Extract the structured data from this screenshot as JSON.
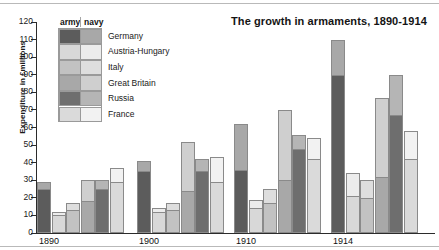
{
  "chart_data": {
    "type": "bar",
    "subtype": "grouped-stacked",
    "title": "The growth in armaments, 1890-1914",
    "xlabel": "",
    "ylabel": "Expenditure in £millions",
    "ylim": [
      0,
      120
    ],
    "ytick_step": 10,
    "yticks": [
      0,
      10,
      20,
      30,
      40,
      50,
      60,
      70,
      80,
      90,
      100,
      110,
      120
    ],
    "grid": false,
    "legend_position": "top-left",
    "legend_headers": [
      "army",
      "navy"
    ],
    "categories": [
      "1890",
      "1900",
      "1910",
      "1914"
    ],
    "series": [
      {
        "name": "Germany",
        "army_color": "#5c5c5c",
        "navy_color": "#a8a8a8",
        "army": [
          25,
          35,
          36,
          90
        ],
        "navy": [
          4,
          6,
          26,
          20
        ],
        "totals": [
          29,
          41,
          62,
          110
        ]
      },
      {
        "name": "Austria-Hungary",
        "army_color": "#d8d8d8",
        "navy_color": "#ececec",
        "army": [
          10,
          12,
          14,
          21
        ],
        "navy": [
          2,
          2,
          5,
          13
        ],
        "totals": [
          12,
          14,
          19,
          34
        ]
      },
      {
        "name": "Italy",
        "army_color": "#c2c2c2",
        "navy_color": "#dedede",
        "army": [
          13,
          13,
          17,
          20
        ],
        "navy": [
          4,
          4,
          8,
          10
        ],
        "totals": [
          17,
          17,
          25,
          30
        ]
      },
      {
        "name": "Great Britain",
        "army_color": "#a8a8a8",
        "navy_color": "#cfcfcf",
        "army": [
          18,
          24,
          30,
          32
        ],
        "navy": [
          12,
          28,
          40,
          45
        ],
        "totals": [
          30,
          52,
          70,
          77
        ]
      },
      {
        "name": "Russia",
        "army_color": "#6e6e6e",
        "navy_color": "#b5b5b5",
        "army": [
          25,
          35,
          48,
          67
        ],
        "navy": [
          5,
          7,
          8,
          23
        ],
        "totals": [
          30,
          42,
          56,
          90
        ]
      },
      {
        "name": "France",
        "army_color": "#dadada",
        "navy_color": "#f2f2f2",
        "army": [
          29,
          29,
          42,
          42
        ],
        "navy": [
          8,
          14,
          12,
          16
        ],
        "totals": [
          37,
          43,
          54,
          58
        ]
      }
    ]
  }
}
